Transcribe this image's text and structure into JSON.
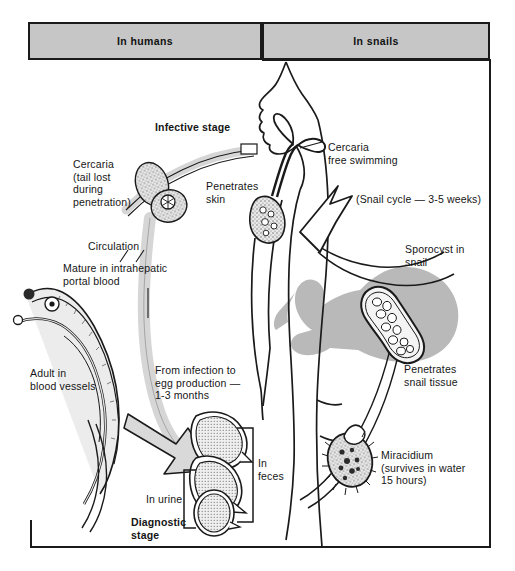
{
  "diagram": {
    "type": "life-cycle-flow-diagram",
    "colors": {
      "header_fill": "#c6c6c6",
      "outline": "#1a1a1a",
      "snail_silhouette": "#b9b9b9",
      "arrow_fill": "#d9d9d9",
      "organism_stipple": "#cfcfcf",
      "page_background": "#ffffff"
    },
    "header": {
      "left": {
        "label": "In humans"
      },
      "right": {
        "label": "In snails"
      }
    },
    "labels": {
      "infective_stage": "Infective stage",
      "cercaria_tail_lost": "Cercaria\n(tail lost\nduring\npenetration)",
      "penetrates_skin": "Penetrates\nskin",
      "circulation": "Circulation",
      "mature_portal_blood": "Mature in intrahepatic\nportal blood",
      "adult_blood_vessels": "Adult in\nblood vessels",
      "infection_to_egg": "From infection to\negg production —\n1-3 months",
      "in_feces": "In\nfeces",
      "in_urine": "In urine",
      "diagnostic_stage": "Diagnostic\nstage",
      "cercaria_free_swimming": "Cercaria\nfree swimming",
      "snail_cycle": "(Snail cycle — 3-5 weeks)",
      "sporocyst_in_snail": "Sporocyst in\nsnail",
      "penetrates_snail_tissue": "Penetrates\nsnail tissue",
      "miracidium": "Miracidium\n(survives in water\n15 hours)"
    },
    "stages": [
      {
        "name": "cercaria-penetrating-skin",
        "host": "human"
      },
      {
        "name": "adult-worm-pair",
        "host": "human"
      },
      {
        "name": "egg-lateral-spine",
        "host": "human"
      },
      {
        "name": "egg-terminal-spine",
        "host": "human"
      },
      {
        "name": "egg-round",
        "host": "human"
      },
      {
        "name": "miracidium",
        "host": "snail"
      },
      {
        "name": "sporocyst",
        "host": "snail"
      },
      {
        "name": "cercaria-free-swimming",
        "host": "snail"
      }
    ]
  }
}
